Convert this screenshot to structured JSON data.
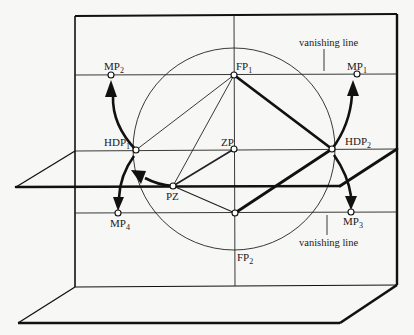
{
  "diagram": {
    "labels": {
      "FP1": {
        "base": "FP",
        "sub": "1"
      },
      "FP2": {
        "base": "FP",
        "sub": "2"
      },
      "MP1": {
        "base": "MP",
        "sub": "1"
      },
      "MP2": {
        "base": "MP",
        "sub": "2"
      },
      "MP3": {
        "base": "MP",
        "sub": "3"
      },
      "MP4": {
        "base": "MP",
        "sub": "4"
      },
      "HDP1": {
        "base": "HDP",
        "sub": "1"
      },
      "HDP2": {
        "base": "HDP",
        "sub": "2"
      },
      "ZP": {
        "base": "ZP",
        "sub": ""
      },
      "PZ": {
        "base": "PZ",
        "sub": ""
      }
    },
    "annotations": {
      "top": "vanishing line",
      "bottom": "vanishing line"
    },
    "colors": {
      "ink": "#111111",
      "paper": "#f7f7f5"
    }
  }
}
